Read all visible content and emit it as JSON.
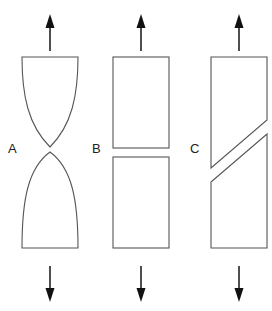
{
  "figure": {
    "specimens": [
      {
        "id": "A",
        "label": "A",
        "shape": "necked-cup-cone",
        "force_top": "up-arrow",
        "force_bottom": "down-arrow"
      },
      {
        "id": "B",
        "label": "B",
        "shape": "flat-brittle-split",
        "force_top": "up-arrow",
        "force_bottom": "down-arrow"
      },
      {
        "id": "C",
        "label": "C",
        "shape": "diagonal-shear-split",
        "force_top": "up-arrow",
        "force_bottom": "down-arrow"
      }
    ]
  },
  "colors": {
    "outline": "#555555",
    "arrow": "#111111",
    "background": "#ffffff"
  }
}
